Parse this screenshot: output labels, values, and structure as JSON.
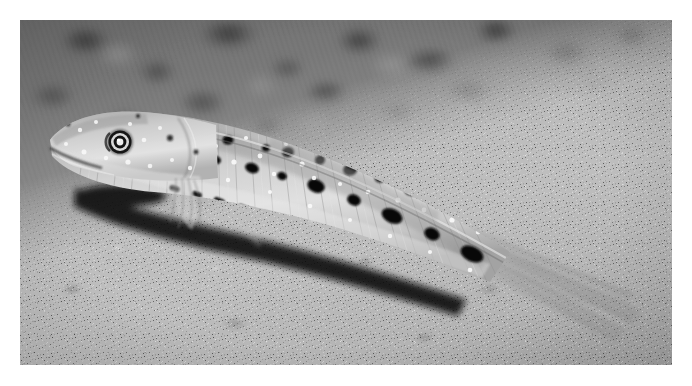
{
  "photo": {
    "title": "Sandperch resting on sandy seabed",
    "description": "Black and white underwater macro photograph of a slender, elongated bottom-dwelling fish (sandperch / goby) lying on rippled sand, body angled from upper-left to lower-right, with rows of dark blotches along the flank and white speckles over the head and back.",
    "subject": "sandperch fish",
    "habitat": "sandy seabed",
    "orientation": "landscape",
    "color_mode": "black and white",
    "frame": {
      "border_color": "#ffffff",
      "border_width_px": 20,
      "photo_left_px": 20,
      "photo_top_px": 20,
      "photo_width_px": 652,
      "photo_height_px": 345
    },
    "palette": {
      "background_dark": "#6f6f6f",
      "background_mid": "#8b8b8b",
      "sand_light": "#bcbcbc",
      "sand_mid": "#a8a8a8",
      "fish_body_light": "#d8d8d8",
      "fish_body_mid": "#b0b0b0",
      "fish_shadow": "#4a4a4a",
      "spot_dark": "#101010",
      "highlight_white": "#f4f4f4"
    },
    "regions": [
      {
        "name": "blurred-background",
        "note": "out-of-focus darker seabed filling the upper portion"
      },
      {
        "name": "foreground-sand",
        "note": "sharp, bright sand grain filling the lower-left"
      },
      {
        "name": "fish-head",
        "note": "head at left with large round eye"
      },
      {
        "name": "fish-body",
        "note": "elongated flank with dark blotch rows"
      },
      {
        "name": "fish-tail",
        "note": "translucent caudal fin fanning to the lower right"
      }
    ],
    "fish_features": {
      "eye_center_x_px": 204,
      "eye_center_y_px": 130,
      "eye_radius_px": 11,
      "spot_rows": 3,
      "dorsal_spot_count": 11,
      "lateral_blotch_count": 8,
      "ventral_dash_count": 14,
      "has_pectoral_fin": true,
      "has_caudal_fin": true,
      "body_angle_deg": 22
    }
  }
}
